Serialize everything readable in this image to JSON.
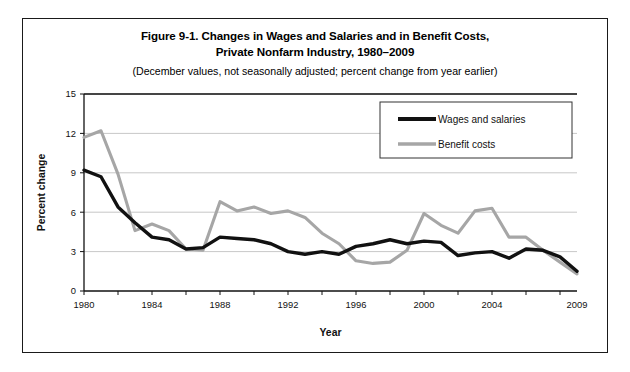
{
  "figure": {
    "title_line1": "Figure 9-1. Changes in Wages and Salaries and in Benefit Costs,",
    "title_line2": "Private Nonfarm Industry, 1980–2009",
    "subtitle": "(December values, not seasonally adjusted; percent change from year earlier)"
  },
  "chart_data": {
    "type": "line",
    "title": "Figure 9-1. Changes in Wages and Salaries and in Benefit Costs, Private Nonfarm Industry, 1980–2009",
    "subtitle": "(December values, not seasonally adjusted; percent change from year earlier)",
    "xlabel": "Year",
    "ylabel": "Percent change",
    "xlim": [
      1980,
      2009
    ],
    "ylim": [
      0,
      15
    ],
    "yticks": [
      0,
      3,
      6,
      9,
      12,
      15
    ],
    "xticks": [
      1980,
      1982,
      1984,
      1986,
      1988,
      1990,
      1992,
      1994,
      1996,
      1998,
      2000,
      2002,
      2004,
      2006,
      2008
    ],
    "xtick_labels_shown": [
      "1980",
      "1984",
      "1988",
      "1992",
      "1996",
      "2000",
      "2004",
      "2009"
    ],
    "grid": "horizontal",
    "legend_position": "top-right",
    "x": [
      1980,
      1981,
      1982,
      1983,
      1984,
      1985,
      1986,
      1987,
      1988,
      1989,
      1990,
      1991,
      1992,
      1993,
      1994,
      1995,
      1996,
      1997,
      1998,
      1999,
      2000,
      2001,
      2002,
      2003,
      2004,
      2005,
      2006,
      2007,
      2008,
      2009
    ],
    "series": [
      {
        "name": "Wages and salaries",
        "color": "#111111",
        "values": [
          9.2,
          8.7,
          6.4,
          5.2,
          4.1,
          3.9,
          3.2,
          3.3,
          4.1,
          4.0,
          3.9,
          3.6,
          3.0,
          2.8,
          3.0,
          2.8,
          3.4,
          3.6,
          3.9,
          3.6,
          3.8,
          3.7,
          2.7,
          2.9,
          3.0,
          2.5,
          3.2,
          3.1,
          2.6,
          1.5
        ]
      },
      {
        "name": "Benefit costs",
        "color": "#a6a6a6",
        "values": [
          11.7,
          12.2,
          8.9,
          4.6,
          5.1,
          4.6,
          3.2,
          3.1,
          6.8,
          6.1,
          6.4,
          5.9,
          6.1,
          5.6,
          4.4,
          3.6,
          2.3,
          2.1,
          2.2,
          3.1,
          5.9,
          5.0,
          4.4,
          6.1,
          6.3,
          4.1,
          4.1,
          3.1,
          2.2,
          1.3
        ]
      }
    ]
  },
  "legend": {
    "items": [
      {
        "label": "Wages and salaries",
        "color": "#111111"
      },
      {
        "label": "Benefit costs",
        "color": "#a6a6a6"
      }
    ]
  },
  "axes": {
    "y_title": "Percent change",
    "x_title": "Year"
  }
}
